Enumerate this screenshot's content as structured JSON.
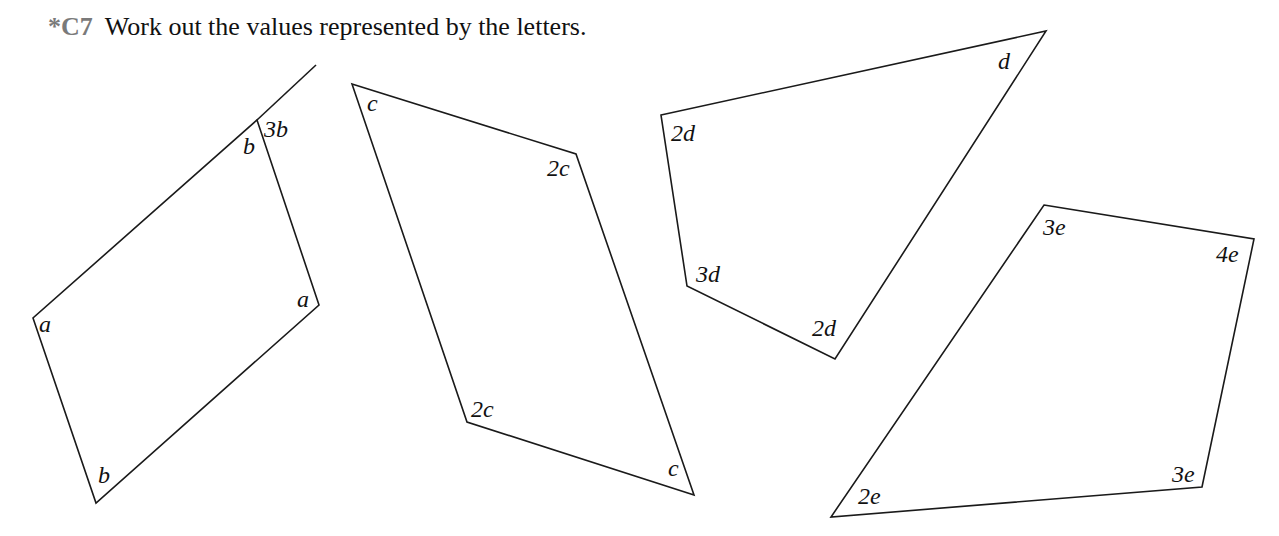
{
  "question": {
    "number": "*C7",
    "text": "Work out the values represented by the letters."
  },
  "shapes": [
    {
      "name": "quadrilateral-a-b",
      "points": "257,120 319,305 96,503 33,318",
      "extension_line": {
        "x1": 257,
        "y1": 120,
        "x2": 316,
        "y2": 65
      },
      "labels": [
        {
          "text": "b",
          "x": 243,
          "y": 154
        },
        {
          "text": "3b",
          "x": 264,
          "y": 137
        },
        {
          "text": "a",
          "x": 297,
          "y": 307
        },
        {
          "text": "a",
          "x": 39,
          "y": 332
        },
        {
          "text": "b",
          "x": 98,
          "y": 483
        }
      ]
    },
    {
      "name": "parallelogram-c",
      "points": "352,84 576,154 694,495 467,422",
      "labels": [
        {
          "text": "c",
          "x": 367,
          "y": 111
        },
        {
          "text": "2c",
          "x": 547,
          "y": 176
        },
        {
          "text": "2c",
          "x": 471,
          "y": 417
        },
        {
          "text": "c",
          "x": 668,
          "y": 476
        }
      ]
    },
    {
      "name": "quadrilateral-d",
      "points": "661,115 1046,31 835,359 687,286",
      "labels": [
        {
          "text": "2d",
          "x": 671,
          "y": 141
        },
        {
          "text": "d",
          "x": 998,
          "y": 69
        },
        {
          "text": "3d",
          "x": 696,
          "y": 282
        },
        {
          "text": "2d",
          "x": 812,
          "y": 336
        }
      ]
    },
    {
      "name": "quadrilateral-e",
      "points": "1044,205 1254,239 1202,487 831,517",
      "labels": [
        {
          "text": "3e",
          "x": 1043,
          "y": 235
        },
        {
          "text": "4e",
          "x": 1216,
          "y": 262
        },
        {
          "text": "3e",
          "x": 1172,
          "y": 482
        },
        {
          "text": "2e",
          "x": 858,
          "y": 504
        }
      ]
    }
  ]
}
